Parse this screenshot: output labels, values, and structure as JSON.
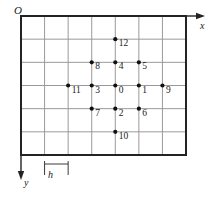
{
  "figure": {
    "kind": "finite-difference-stencil-grid",
    "caption": "",
    "axes": {
      "origin_label": "O",
      "x_label": "x",
      "y_label": "y",
      "x_direction": "right",
      "y_direction": "down",
      "spacing_label": "h"
    },
    "grid": {
      "columns": 7,
      "rows": 6,
      "cell_width_px": 23.6,
      "cell_height_px": 23.2,
      "left_px": 21,
      "top_px": 16,
      "right_px": 186,
      "bottom_px": 155,
      "border_color": "#232323",
      "line_color": "#9a9a9a",
      "border_width_px": 2,
      "line_width_px": 1
    },
    "point_style": {
      "color": "#111111",
      "radius_px": 2.1,
      "label_offset_x_px": 3.5,
      "label_offset_y_px": 9.5
    }
  },
  "chart_data": {
    "type": "scatter",
    "title": "",
    "subtitle": "",
    "xlabel": "x",
    "ylabel": "y",
    "legend": [],
    "annotations": [
      "h"
    ],
    "grid": true,
    "xlim": [
      0,
      7
    ],
    "ylim": [
      0,
      6
    ],
    "x_ticks": [
      0,
      1,
      2,
      3,
      4,
      5,
      6,
      7
    ],
    "y_ticks": [
      0,
      1,
      2,
      3,
      4,
      5,
      6
    ],
    "note": "Grid coordinates are in units of h; x increases right, y increases downward from origin O at top-left.",
    "points": [
      {
        "label": "0",
        "gx": 4,
        "gy": 3
      },
      {
        "label": "1",
        "gx": 5,
        "gy": 3
      },
      {
        "label": "2",
        "gx": 4,
        "gy": 4
      },
      {
        "label": "3",
        "gx": 3,
        "gy": 3
      },
      {
        "label": "4",
        "gx": 4,
        "gy": 2
      },
      {
        "label": "5",
        "gx": 5,
        "gy": 2
      },
      {
        "label": "6",
        "gx": 5,
        "gy": 4
      },
      {
        "label": "7",
        "gx": 3,
        "gy": 4
      },
      {
        "label": "8",
        "gx": 3,
        "gy": 2
      },
      {
        "label": "9",
        "gx": 6,
        "gy": 3
      },
      {
        "label": "10",
        "gx": 4,
        "gy": 5
      },
      {
        "label": "11",
        "gx": 2,
        "gy": 3
      },
      {
        "label": "12",
        "gx": 4,
        "gy": 1
      }
    ]
  }
}
